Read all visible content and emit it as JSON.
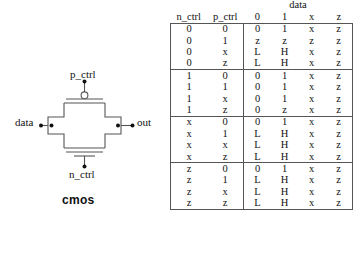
{
  "figure": {
    "name": "cmos-transmission-gate",
    "caption": "cmos",
    "terminals": {
      "top_label": "p_ctrl",
      "bottom_label": "n_ctrl",
      "left_label": "data",
      "right_label": "out"
    },
    "line_color": "#555555",
    "text_color": "#111111"
  },
  "table": {
    "group_header": "data",
    "columns": [
      "n_ctrl",
      "p_ctrl",
      "0",
      "1",
      "x",
      "z"
    ],
    "ctrl_headers": [
      "n_ctrl",
      "p_ctrl"
    ],
    "data_headers": [
      "0",
      "1",
      "x",
      "z"
    ],
    "blocks": [
      {
        "rows": [
          {
            "n_ctrl": "0",
            "p_ctrl": "0",
            "out": [
              "0",
              "1",
              "x",
              "z"
            ]
          },
          {
            "n_ctrl": "0",
            "p_ctrl": "1",
            "out": [
              "z",
              "z",
              "z",
              "z"
            ]
          },
          {
            "n_ctrl": "0",
            "p_ctrl": "x",
            "out": [
              "L",
              "H",
              "x",
              "z"
            ]
          },
          {
            "n_ctrl": "0",
            "p_ctrl": "z",
            "out": [
              "L",
              "H",
              "x",
              "z"
            ]
          }
        ]
      },
      {
        "rows": [
          {
            "n_ctrl": "1",
            "p_ctrl": "0",
            "out": [
              "0",
              "1",
              "x",
              "z"
            ]
          },
          {
            "n_ctrl": "1",
            "p_ctrl": "1",
            "out": [
              "0",
              "1",
              "x",
              "z"
            ]
          },
          {
            "n_ctrl": "1",
            "p_ctrl": "x",
            "out": [
              "0",
              "1",
              "x",
              "z"
            ]
          },
          {
            "n_ctrl": "1",
            "p_ctrl": "z",
            "out": [
              "0",
              "z",
              "x",
              "z"
            ]
          }
        ]
      },
      {
        "rows": [
          {
            "n_ctrl": "x",
            "p_ctrl": "0",
            "out": [
              "0",
              "1",
              "x",
              "z"
            ]
          },
          {
            "n_ctrl": "x",
            "p_ctrl": "1",
            "out": [
              "L",
              "H",
              "x",
              "z"
            ]
          },
          {
            "n_ctrl": "x",
            "p_ctrl": "x",
            "out": [
              "L",
              "H",
              "x",
              "z"
            ]
          },
          {
            "n_ctrl": "x",
            "p_ctrl": "z",
            "out": [
              "L",
              "H",
              "x",
              "z"
            ]
          }
        ]
      },
      {
        "rows": [
          {
            "n_ctrl": "z",
            "p_ctrl": "0",
            "out": [
              "0",
              "1",
              "x",
              "z"
            ]
          },
          {
            "n_ctrl": "z",
            "p_ctrl": "1",
            "out": [
              "L",
              "H",
              "x",
              "z"
            ]
          },
          {
            "n_ctrl": "z",
            "p_ctrl": "x",
            "out": [
              "L",
              "H",
              "x",
              "z"
            ]
          },
          {
            "n_ctrl": "z",
            "p_ctrl": "z",
            "out": [
              "L",
              "H",
              "x",
              "z"
            ]
          }
        ]
      }
    ]
  }
}
